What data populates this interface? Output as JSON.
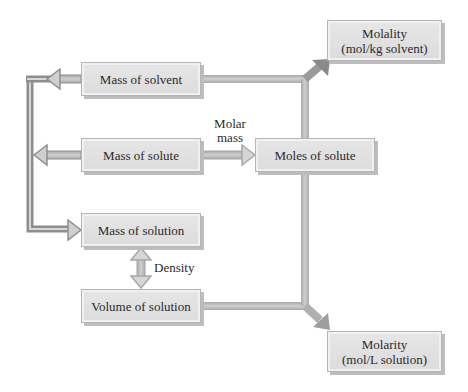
{
  "diagram": {
    "type": "flowchart",
    "topic": "Conversions between concentration units",
    "colors": {
      "background": "#ffffff",
      "box_fill": "#e0e0e0",
      "box_border": "#b5b5b5",
      "arrow_dark": "#8c8c8c",
      "arrow_light": "#b8b8b8",
      "text": "#2a2a2a"
    },
    "nodes": {
      "mass_solvent": {
        "label": "Mass of solvent"
      },
      "mass_solute": {
        "label": "Mass of solute"
      },
      "mass_solution": {
        "label": "Mass of solution"
      },
      "volume_solution": {
        "label": "Volume of solution"
      },
      "moles_solute": {
        "label": "Moles of solute"
      },
      "molality": {
        "line1": "Molality",
        "line2": "(mol/kg solvent)"
      },
      "molarity": {
        "line1": "Molarity",
        "line2": "(mol/L solution)"
      }
    },
    "edge_labels": {
      "molar_mass_line1": "Molar",
      "molar_mass_line2": "mass",
      "density": "Density"
    },
    "edges": [
      {
        "from": "Mass of solvent",
        "to": "Mass of solution",
        "via": "left bus"
      },
      {
        "from": "Mass of solute",
        "to": "Mass of solution",
        "via": "left bus"
      },
      {
        "from": "Mass of solute",
        "to": "Moles of solute",
        "label": "Molar mass"
      },
      {
        "from": "Mass of solution",
        "to": "Volume of solution",
        "label": "Density",
        "bidirectional": true
      },
      {
        "from": "Mass of solvent",
        "to": "Molality"
      },
      {
        "from": "Moles of solute",
        "to": "Molality"
      },
      {
        "from": "Moles of solute",
        "to": "Molarity"
      },
      {
        "from": "Volume of solution",
        "to": "Molarity"
      }
    ]
  }
}
